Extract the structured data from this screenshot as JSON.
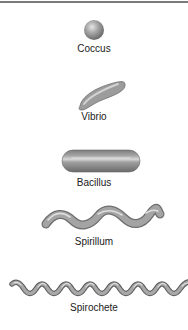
{
  "diagram": {
    "colors": {
      "rule": "#7a7a7a",
      "body_dark": "#6e6e6e",
      "body_mid": "#9a9a9a",
      "body_light": "#d8d8d8",
      "label": "#1a1a1a"
    },
    "shapes": [
      {
        "id": "coccus",
        "label": "Coccus"
      },
      {
        "id": "vibrio",
        "label": "Vibrio"
      },
      {
        "id": "bacillus",
        "label": "Bacillus"
      },
      {
        "id": "spirillum",
        "label": "Spirillum"
      },
      {
        "id": "spirochete",
        "label": "Spirochete"
      }
    ]
  }
}
